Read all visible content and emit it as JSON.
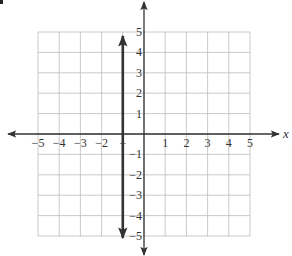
{
  "chart_data": {
    "type": "line",
    "title": "",
    "xlabel": "x",
    "ylabel": "",
    "xlim": [
      -5,
      5
    ],
    "ylim": [
      -5,
      5
    ],
    "grid": true,
    "x_ticks": [
      -5,
      -4,
      -3,
      -2,
      -1,
      1,
      2,
      3,
      4,
      5
    ],
    "x_tick_labels": [
      "−5",
      "−4",
      "−3",
      "−2",
      "−",
      "1",
      "2",
      "3",
      "4",
      "5"
    ],
    "y_ticks": [
      5,
      4,
      3,
      2,
      1,
      -1,
      -2,
      -3,
      -4,
      -5
    ],
    "y_tick_labels": [
      "5",
      "4",
      "3",
      "2",
      "1",
      "−1",
      "−2",
      "−3",
      "−4",
      "−5"
    ],
    "series": [
      {
        "name": "vertical line x = -1",
        "x": [
          -1,
          -1
        ],
        "y": [
          -5,
          5
        ],
        "arrows": "both",
        "color": "#333333"
      }
    ],
    "legend": null
  },
  "colors": {
    "grid": "#bdbdbd",
    "axis": "#333333",
    "line": "#333333",
    "background": "#ffffff"
  }
}
